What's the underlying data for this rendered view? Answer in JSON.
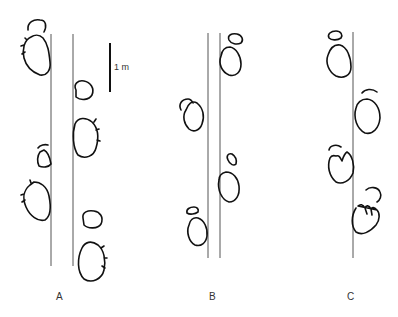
{
  "figure": {
    "type": "trackway diagram",
    "scale_bar": {
      "label": "1 m"
    },
    "trackways": [
      {
        "id": "A",
        "label": "A",
        "midlines": 2,
        "footprints": 8
      },
      {
        "id": "B",
        "label": "B",
        "midlines": 2,
        "footprints": 8
      },
      {
        "id": "C",
        "label": "C",
        "midlines": 1,
        "footprints": 8
      }
    ]
  }
}
